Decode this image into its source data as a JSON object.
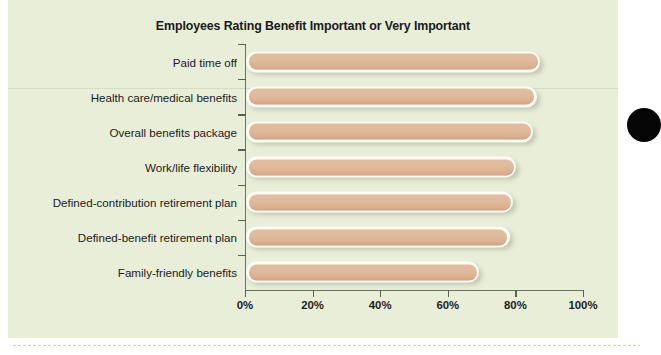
{
  "chart": {
    "title": "Employees Rating Benefit Important or Very Important",
    "background_color": "#e9eed9",
    "bar_color": "#e0b89a",
    "axis_color": "#6d6f63",
    "edge_dot_color": "#060606"
  },
  "chart_data": {
    "type": "bar",
    "orientation": "horizontal",
    "title": "Employees Rating Benefit Important or Very Important",
    "xlabel": "",
    "ylabel": "",
    "xlim": [
      0,
      100
    ],
    "grid": false,
    "legend": false,
    "categories": [
      "Paid time off",
      "Health care/medical benefits",
      "Overall benefits package",
      "Work/life flexibility",
      "Defined-contribution retirement plan",
      "Defined-benefit retirement plan",
      "Family-friendly benefits"
    ],
    "values": [
      87,
      86,
      85,
      80,
      79,
      78,
      69
    ],
    "tick_labels": [
      "0%",
      "20%",
      "40%",
      "60%",
      "80%",
      "100%"
    ],
    "tick_values": [
      0,
      20,
      40,
      60,
      80,
      100
    ]
  }
}
